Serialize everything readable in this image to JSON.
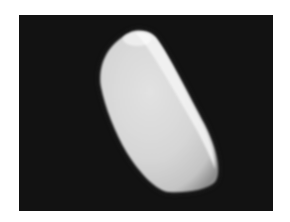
{
  "figure": {
    "background_color": "#121212",
    "object_color": "#e6e6e6",
    "object_highlight_color": "#ffffff",
    "object_shadow_color": "#9a9a9a",
    "caption": ""
  }
}
